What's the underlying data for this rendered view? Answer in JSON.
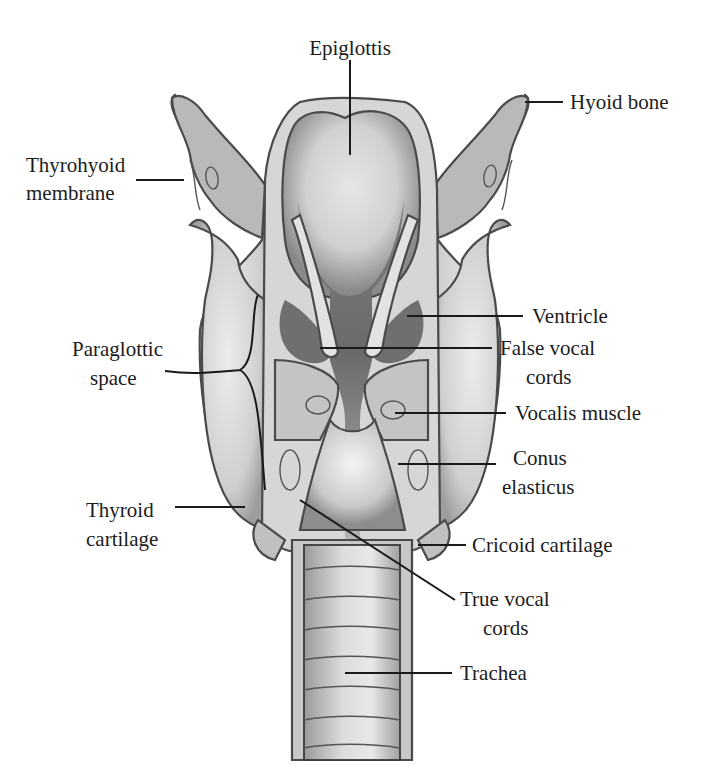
{
  "diagram": {
    "labels": {
      "epiglottis": "Epiglottis",
      "hyoid_bone": "Hyoid bone",
      "thyrohyoid_membrane": [
        "Thyrohyoid",
        "membrane"
      ],
      "ventricle": "Ventricle",
      "paraglottic_space": [
        "Paraglottic",
        "space"
      ],
      "false_vocal_cords": [
        "False vocal",
        "cords"
      ],
      "vocalis_muscle": "Vocalis muscle",
      "conus_elasticus": [
        "Conus",
        "elasticus"
      ],
      "thyroid_cartilage": [
        "Thyroid",
        "cartilage"
      ],
      "cricoid_cartilage": "Cricoid cartilage",
      "true_vocal_cords": [
        "True vocal",
        "cords"
      ],
      "trachea": "Trachea"
    }
  }
}
